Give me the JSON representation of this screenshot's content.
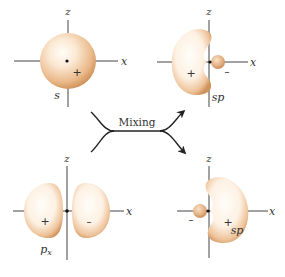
{
  "diagram": {
    "colors": {
      "orbital_highlight": "#fffaf2",
      "orbital_mid": "#f3d2ae",
      "orbital_edge": "#c98a52",
      "axis": "#444444",
      "text": "#333333"
    },
    "panels": [
      {
        "id": "s-orbital",
        "axis_z_label": "z",
        "axis_x_label": "x",
        "orbital_label": "s",
        "signs": [
          "+"
        ]
      },
      {
        "id": "sp-orbital-1",
        "axis_z_label": "z",
        "axis_x_label": "x",
        "orbital_label": "sp",
        "signs": [
          "+",
          "–"
        ]
      },
      {
        "id": "px-orbital",
        "axis_z_label": "z",
        "axis_x_label": "x",
        "orbital_label": "p",
        "orbital_label_sub": "x",
        "signs": [
          "+",
          "–"
        ]
      },
      {
        "id": "sp-orbital-2",
        "axis_z_label": "z",
        "axis_x_label": "x",
        "orbital_label": "sp",
        "signs": [
          "+",
          "–"
        ]
      }
    ],
    "mixing": {
      "label": "Mixing"
    }
  }
}
